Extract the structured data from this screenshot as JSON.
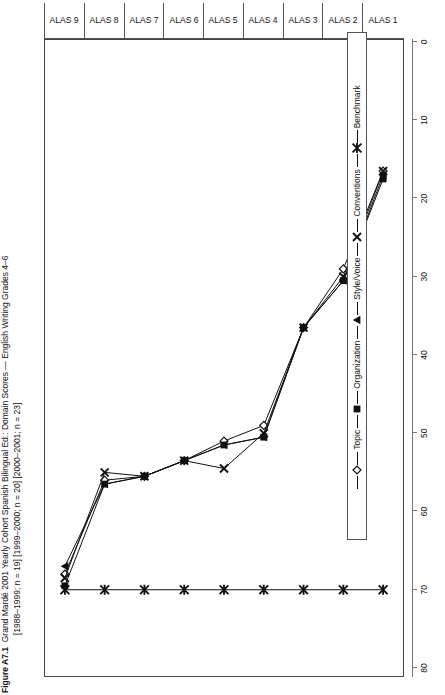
{
  "figure": {
    "number": "Figure A7.1",
    "title_line1": "Grand Mardé 2001 Yearly Cohort Spanish Bilingual Ed.: Domain Scores — English Writing Grades 4–6",
    "title_line2": "[1988–1999; n = 19] [1999–2000; n = 20] [2000–2001; n = 23]"
  },
  "chart_data": {
    "type": "line",
    "title": "Grand Mardé 2001 Yearly Cohort Spanish Bilingual Ed.: Domain Scores — English Writing Grades 4–6",
    "xlabel": "",
    "ylabel": "",
    "orientation": "horizontal-categories-vertical-axis",
    "categories": [
      "ALAS 1",
      "ALAS 2",
      "ALAS 3",
      "ALAS 4",
      "ALAS 5",
      "ALAS 6",
      "ALAS 7",
      "ALAS 8",
      "ALAS 9"
    ],
    "category_groups": [
      {
        "label": "98–99",
        "from": "ALAS 1",
        "to": "ALAS 3"
      },
      {
        "label": "99–00",
        "from": "ALAS 4",
        "to": "ALAS 6"
      },
      {
        "label": "00–01",
        "from": "ALAS 7",
        "to": "ALAS 9"
      }
    ],
    "value_axis": {
      "min": 0,
      "max": 80,
      "ticks": [
        0,
        10,
        20,
        30,
        40,
        50,
        60,
        70,
        80
      ],
      "tick_labels": [
        "0",
        "10",
        "20",
        "30",
        "40",
        "50",
        "60",
        "70",
        "80"
      ],
      "direction": "right-to-left"
    },
    "grid": false,
    "legend_position": "bottom",
    "series": [
      {
        "name": "Topic",
        "marker": "open-diamond",
        "values": [
          16.5,
          29.0,
          36.5,
          49.0,
          51.0,
          53.5,
          55.5,
          56.0,
          68.0
        ]
      },
      {
        "name": "Organization",
        "marker": "filled-square",
        "values": [
          17.5,
          30.5,
          36.5,
          50.5,
          51.5,
          53.5,
          55.5,
          56.5,
          69.5
        ]
      },
      {
        "name": "Style/Voice",
        "marker": "filled-triangle",
        "values": [
          17.0,
          30.5,
          36.5,
          50.5,
          51.5,
          53.5,
          55.5,
          56.5,
          67.0
        ]
      },
      {
        "name": "Conventions",
        "marker": "x-cross",
        "values": [
          16.5,
          30.0,
          36.5,
          50.0,
          54.5,
          53.5,
          55.5,
          55.0,
          68.5
        ]
      },
      {
        "name": "Benchmark",
        "marker": "star",
        "values": [
          70.0,
          70.0,
          70.0,
          70.0,
          70.0,
          70.0,
          70.0,
          70.0,
          70.0
        ]
      }
    ]
  },
  "legend": {
    "items": [
      {
        "label": "Topic",
        "marker": "open-diamond"
      },
      {
        "label": "Organization",
        "marker": "filled-square"
      },
      {
        "label": "Style/Voice",
        "marker": "filled-triangle"
      },
      {
        "label": "Conventions",
        "marker": "x-cross"
      },
      {
        "label": "Benchmark",
        "marker": "star"
      }
    ]
  },
  "colors": {
    "series": "#111111",
    "axis": "#555555",
    "panel_border": "#444444",
    "background": "#ffffff"
  }
}
